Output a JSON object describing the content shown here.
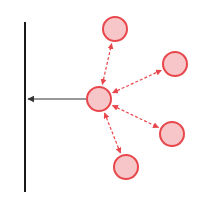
{
  "diagram": {
    "type": "force-diagram",
    "colors": {
      "wall": "#1a1a1a",
      "arrow_main": "#333333",
      "node_fill": "#f7c6c9",
      "node_stroke": "#e8474c",
      "dashed_arrow": "#e8474c"
    },
    "wall": {
      "x": 25,
      "y1": 22,
      "y2": 192
    },
    "center_node": {
      "id": "center",
      "cx": 99,
      "cy": 99,
      "r": 12
    },
    "outer_nodes": [
      {
        "id": "top",
        "cx": 115,
        "cy": 29,
        "r": 12
      },
      {
        "id": "upper-right",
        "cx": 175,
        "cy": 64,
        "r": 12
      },
      {
        "id": "lower-right",
        "cx": 172,
        "cy": 134,
        "r": 12
      },
      {
        "id": "bottom",
        "cx": 126,
        "cy": 167,
        "r": 12
      }
    ],
    "main_arrow": {
      "from": "center",
      "to": "wall",
      "x1": 86,
      "y1": 99,
      "x2": 28,
      "y2": 99
    }
  }
}
